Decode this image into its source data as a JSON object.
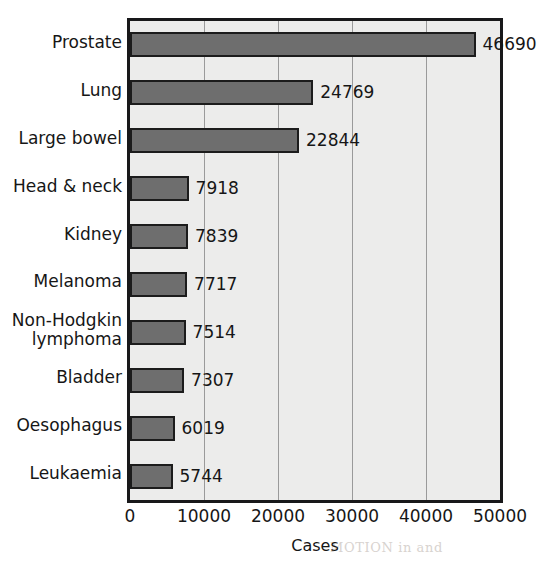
{
  "chart_data": {
    "type": "bar",
    "orientation": "horizontal",
    "title": "",
    "xlabel": "Cases",
    "ylabel": "",
    "xlim": [
      0,
      50000
    ],
    "xticks": [
      "0",
      "10000",
      "20000",
      "30000",
      "40000",
      "50000"
    ],
    "xtick_values": [
      0,
      10000,
      20000,
      30000,
      40000,
      50000
    ],
    "grid": "vertical",
    "legend": "none",
    "categories": [
      "Prostate",
      "Lung",
      "Large bowel",
      "Head & neck",
      "Kidney",
      "Melanoma",
      "Non-Hodgkin\nlymphoma",
      "Bladder",
      "Oesophagus",
      "Leukaemia"
    ],
    "values": [
      46690,
      24769,
      22844,
      7918,
      7839,
      7717,
      7514,
      7307,
      6019,
      5744
    ],
    "data_labels": [
      "46690",
      "24769",
      "22844",
      "7918",
      "7839",
      "7717",
      "7514",
      "7307",
      "6019",
      "5744"
    ],
    "colors": {
      "bar_fill": "#6e6e6e",
      "bar_outline": "#1c1c1c",
      "plot_background": "#ececeb",
      "gridline": "#9a9a9a",
      "frame": "#18181a",
      "text": "#161616"
    }
  },
  "bleed_through": [
    "sented by the cancer",
    "to the be noted",
    "appropriate, the",
    "a highly complexion",
    "so. Evidence s",
    "an 80+ scale less thes",
    "h test fit incident",
    "any way of oct omly, yield",
    "Nevertheless, known ov",
    "effectively 10% as - in the",
    "es much not more ck on",
    "rve the use (3.4.1)",
    "MOTION in and"
  ]
}
